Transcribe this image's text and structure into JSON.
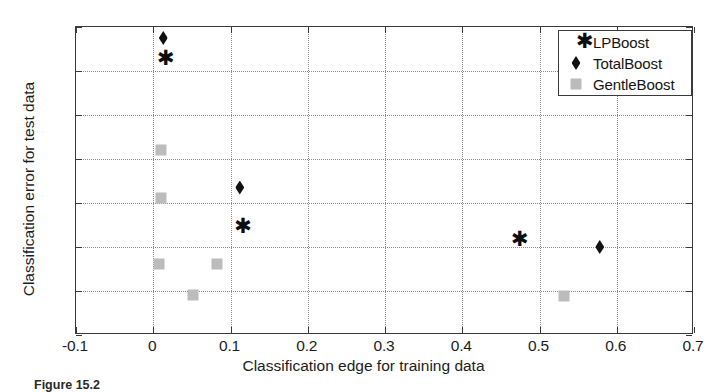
{
  "chart_data": {
    "type": "scatter",
    "title": "",
    "xlabel": "Classification edge for training data",
    "ylabel": "Classification error for test data",
    "xlim": [
      -0.1,
      0.7
    ],
    "ylim": [
      0.16,
      0.23
    ],
    "xticks": [
      "-0.1",
      "0",
      "0.1",
      "0.2",
      "0.3",
      "0.4",
      "0.5",
      "0.6",
      "0.7"
    ],
    "xtick_values": [
      -0.1,
      0,
      0.1,
      0.2,
      0.3,
      0.4,
      0.5,
      0.6,
      0.7
    ],
    "yticks": [
      "0.16",
      "0.17",
      "0.18",
      "0.19",
      "0.2",
      "0.21",
      "0.22",
      "0.23"
    ],
    "ytick_values": [
      0.16,
      0.17,
      0.18,
      0.19,
      0.2,
      0.21,
      0.22,
      0.23
    ],
    "grid": true,
    "legend_position": "top-right",
    "series": [
      {
        "name": "LPBoost",
        "marker": "asterisk",
        "color": "#0d0d0d",
        "points": [
          {
            "x": 0.005,
            "y": 0.2228
          },
          {
            "x": 0.105,
            "y": 0.1845
          },
          {
            "x": 0.463,
            "y": 0.1816
          }
        ]
      },
      {
        "name": "TotalBoost",
        "marker": "diamond",
        "color": "#111111",
        "points": [
          {
            "x": 0.013,
            "y": 0.2275
          },
          {
            "x": 0.112,
            "y": 0.1935
          },
          {
            "x": 0.578,
            "y": 0.18
          }
        ]
      },
      {
        "name": "GentleBoost",
        "marker": "square",
        "color": "#bcbcbc",
        "points": [
          {
            "x": 0.01,
            "y": 0.202
          },
          {
            "x": 0.01,
            "y": 0.1912
          },
          {
            "x": 0.008,
            "y": 0.1762
          },
          {
            "x": 0.052,
            "y": 0.1692
          },
          {
            "x": 0.082,
            "y": 0.1762
          },
          {
            "x": 0.532,
            "y": 0.1688
          }
        ]
      }
    ]
  },
  "legend": {
    "entries": [
      {
        "label": "LPBoost",
        "marker": "asterisk"
      },
      {
        "label": "TotalBoost",
        "marker": "diamond"
      },
      {
        "label": "GentleBoost",
        "marker": "square"
      }
    ]
  },
  "caption": {
    "prefix": "Figure 15.2",
    "text": "Test error versus training edge for several boosting algorithms"
  }
}
